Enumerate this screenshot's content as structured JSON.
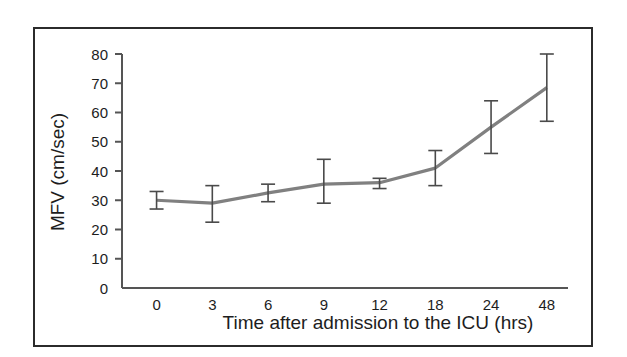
{
  "figure": {
    "border_color": "#2b2b2b",
    "background": "#ffffff"
  },
  "chart_data": {
    "type": "line",
    "title": "",
    "subtitle": "",
    "xlabel": "Time after admission to the ICU (hrs)",
    "ylabel": "MFV (cm/sec)",
    "categories": [
      "0",
      "3",
      "6",
      "9",
      "12",
      "18",
      "24",
      "48"
    ],
    "values": [
      30,
      29,
      32.5,
      35.5,
      36,
      41,
      55,
      68.5
    ],
    "error_low": [
      27,
      22.5,
      29.5,
      29,
      34,
      35,
      46,
      57
    ],
    "error_high": [
      33,
      35,
      35.5,
      44,
      37.5,
      47,
      64,
      80
    ],
    "yticks": [
      0,
      10,
      20,
      30,
      40,
      50,
      60,
      70,
      80
    ],
    "ylim": [
      0,
      80
    ],
    "xticklabels": [
      "0",
      "3",
      "6",
      "9",
      "12",
      "18",
      "24",
      "48"
    ],
    "grid": false,
    "legend": false,
    "legend_position": "none",
    "series": [
      {
        "name": "MFV",
        "values": [
          30,
          29,
          32.5,
          35.5,
          36,
          41,
          55,
          68.5
        ],
        "color": "#808080"
      }
    ],
    "line_color": "#808080",
    "errorbar_color": "#4a4a4a",
    "axis_color": "#555555"
  }
}
